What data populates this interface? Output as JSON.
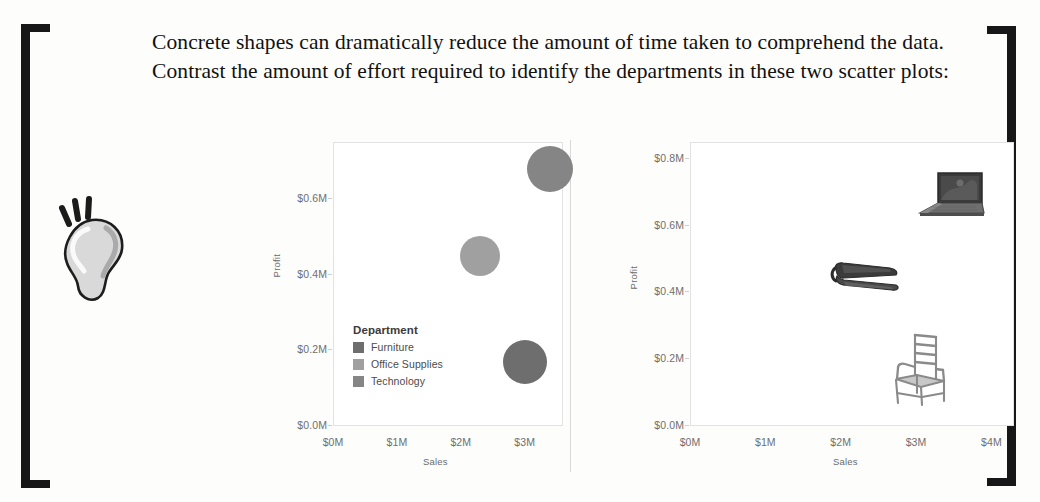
{
  "document": {
    "intro_text": "Concrete shapes can dramatically reduce the amount of time taken to comprehend the data. Contrast the amount of effort required to identify the departments in these two scatter plots:",
    "tip_icon": "lightbulb-icon",
    "bracket_left": "left-bracket-ornament",
    "bracket_right": "right-bracket-ornament"
  },
  "palette": {
    "furniture": "#6e6e6e",
    "office_supplies": "#a0a0a0",
    "technology": "#858585",
    "axis_text": "#6f6f6f",
    "frame": "#e2e2e2",
    "ink": "#171717"
  },
  "chart_data": [
    {
      "id": "scatter-abstract",
      "type": "scatter",
      "title": "",
      "xlabel": "Sales",
      "ylabel": "Profit",
      "xlim": [
        0,
        3.6
      ],
      "ylim": [
        0,
        0.75
      ],
      "grid": false,
      "xticks": [
        "$0M",
        "$1M",
        "$2M",
        "$3M"
      ],
      "xtick_values": [
        0,
        1,
        2,
        3
      ],
      "yticks": [
        "$0.0M",
        "$0.2M",
        "$0.4M",
        "$0.6M"
      ],
      "ytick_values": [
        0.0,
        0.2,
        0.4,
        0.6
      ],
      "legend": {
        "title": "Department",
        "position": "inside-lower-left",
        "entries": [
          {
            "label": "Furniture",
            "color": "#6e6e6e"
          },
          {
            "label": "Office Supplies",
            "color": "#a0a0a0"
          },
          {
            "label": "Technology",
            "color": "#858585"
          }
        ]
      },
      "points": [
        {
          "name": "Technology",
          "x": 3.4,
          "y": 0.68,
          "size": 46,
          "color": "#858585",
          "marker": "circle"
        },
        {
          "name": "Office Supplies",
          "x": 2.3,
          "y": 0.45,
          "size": 40,
          "color": "#a0a0a0",
          "marker": "circle"
        },
        {
          "name": "Furniture",
          "x": 3.0,
          "y": 0.17,
          "size": 44,
          "color": "#6e6e6e",
          "marker": "circle"
        }
      ]
    },
    {
      "id": "scatter-pictograph",
      "type": "scatter",
      "title": "",
      "xlabel": "Sales",
      "ylabel": "Profit",
      "xlim": [
        0,
        4.3
      ],
      "ylim": [
        0,
        0.85
      ],
      "grid": false,
      "xticks": [
        "$0M",
        "$1M",
        "$2M",
        "$3M",
        "$4M"
      ],
      "xtick_values": [
        0,
        1,
        2,
        3,
        4
      ],
      "yticks": [
        "$0.0M",
        "$0.2M",
        "$0.4M",
        "$0.6M",
        "$0.8M"
      ],
      "ytick_values": [
        0.0,
        0.2,
        0.4,
        0.6,
        0.8
      ],
      "legend": null,
      "points": [
        {
          "name": "Technology",
          "x": 3.45,
          "y": 0.69,
          "marker": "laptop-icon"
        },
        {
          "name": "Office Supplies",
          "x": 2.35,
          "y": 0.45,
          "marker": "stapler-icon"
        },
        {
          "name": "Furniture",
          "x": 3.05,
          "y": 0.17,
          "marker": "chair-icon"
        }
      ]
    }
  ]
}
